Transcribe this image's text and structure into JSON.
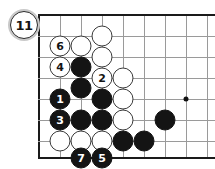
{
  "diagram": {
    "move_badge": "11",
    "board": {
      "cell": 21,
      "origin_x": 39,
      "origin_y": 15,
      "cols": 9,
      "rows": 7,
      "left_edge": true,
      "top_edge": true,
      "bottom_edge": true,
      "right_edge": false,
      "star_points": [
        {
          "x": 186,
          "y": 99
        }
      ],
      "grid_color": "#9a9a9a",
      "edge_color": "#1a1a1a"
    },
    "colors": {
      "black_stone": "#141414",
      "white_stone": "#ffffff",
      "white_stone_border": "#3a3a3a",
      "black_label": "#ffffff",
      "white_label": "#141414",
      "badge_ring": "#c9c9c9"
    },
    "stones": [
      {
        "color": "white",
        "x": 102,
        "y": 36,
        "label": ""
      },
      {
        "color": "white",
        "x": 60,
        "y": 46,
        "label": "6"
      },
      {
        "color": "white",
        "x": 81,
        "y": 46,
        "label": ""
      },
      {
        "color": "white",
        "x": 102,
        "y": 57,
        "label": ""
      },
      {
        "color": "white",
        "x": 60,
        "y": 67,
        "label": "4"
      },
      {
        "color": "black",
        "x": 81,
        "y": 67,
        "label": ""
      },
      {
        "color": "black",
        "x": 81,
        "y": 88,
        "label": ""
      },
      {
        "color": "white",
        "x": 102,
        "y": 78,
        "label": "2"
      },
      {
        "color": "white",
        "x": 123,
        "y": 78,
        "label": ""
      },
      {
        "color": "black",
        "x": 60,
        "y": 99,
        "label": "1"
      },
      {
        "color": "black",
        "x": 102,
        "y": 99,
        "label": ""
      },
      {
        "color": "white",
        "x": 123,
        "y": 99,
        "label": ""
      },
      {
        "color": "black",
        "x": 60,
        "y": 120,
        "label": "3"
      },
      {
        "color": "black",
        "x": 81,
        "y": 120,
        "label": ""
      },
      {
        "color": "black",
        "x": 102,
        "y": 120,
        "label": ""
      },
      {
        "color": "white",
        "x": 123,
        "y": 120,
        "label": ""
      },
      {
        "color": "black",
        "x": 165,
        "y": 120,
        "label": ""
      },
      {
        "color": "white",
        "x": 60,
        "y": 141,
        "label": ""
      },
      {
        "color": "white",
        "x": 81,
        "y": 141,
        "label": ""
      },
      {
        "color": "white",
        "x": 102,
        "y": 141,
        "label": ""
      },
      {
        "color": "black",
        "x": 123,
        "y": 141,
        "label": ""
      },
      {
        "color": "black",
        "x": 144,
        "y": 141,
        "label": ""
      },
      {
        "color": "black",
        "x": 81,
        "y": 158,
        "label": "7"
      },
      {
        "color": "black",
        "x": 102,
        "y": 158,
        "label": "5"
      }
    ]
  }
}
